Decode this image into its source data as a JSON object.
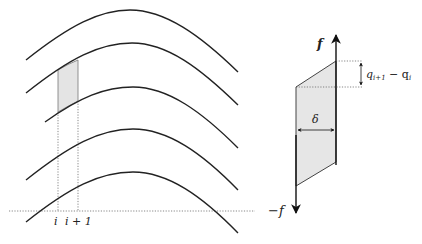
{
  "left_panel": {
    "curves": [
      {
        "start": [
          26,
          60
        ],
        "peak": [
          130,
          10
        ],
        "end": [
          238,
          72
        ]
      },
      {
        "start": [
          26,
          93
        ],
        "peak": [
          132,
          43
        ],
        "end": [
          238,
          105
        ]
      },
      {
        "start": [
          45,
          122
        ],
        "peak": [
          133,
          87
        ],
        "end": [
          238,
          148
        ]
      },
      {
        "start": [
          26,
          180
        ],
        "peak": [
          133,
          129
        ],
        "end": [
          238,
          190
        ]
      },
      {
        "start": [
          26,
          222
        ],
        "peak": [
          133,
          172
        ],
        "end": [
          238,
          233
        ]
      }
    ],
    "shaded_cell": {
      "x_left": 58,
      "x_right": 78
    },
    "baseline_y": 211,
    "tick_labels": {
      "i": "i",
      "i_plus_1": "i + 1"
    }
  },
  "right_panel": {
    "axis_top_label": "f",
    "axis_bottom_label": "−f",
    "jump_label": "q",
    "jump_label_sub1": "i+1",
    "jump_label_minus": " − q",
    "jump_label_sub2": "i",
    "width_label": "δ"
  },
  "colors": {
    "curve": "#222222",
    "fill": "#e4e4e4",
    "dotted": "#555555"
  }
}
